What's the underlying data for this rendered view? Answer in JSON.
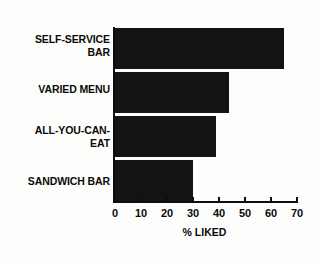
{
  "chart_data": {
    "type": "bar",
    "orientation": "horizontal",
    "title": "",
    "xlabel": "% LIKED",
    "ylabel": "",
    "categories": [
      "SELF-SERVICE\nBAR",
      "VARIED MENU",
      "ALL-YOU-CAN-\nEAT",
      "SANDWICH BAR"
    ],
    "values": [
      65,
      44,
      39,
      30
    ],
    "xlim": [
      0,
      70
    ],
    "xticks": [
      0,
      10,
      20,
      30,
      40,
      50,
      60,
      70
    ],
    "xtick_labels": [
      "0",
      "10",
      "20",
      "30",
      "40",
      "50",
      "60",
      "70"
    ],
    "grid": false,
    "legend": null,
    "bar_color": "#131313",
    "axis_color": "#0d0d0d",
    "background_color": "#fdfdfb"
  },
  "axis": {
    "x_title": "% LIKED"
  }
}
